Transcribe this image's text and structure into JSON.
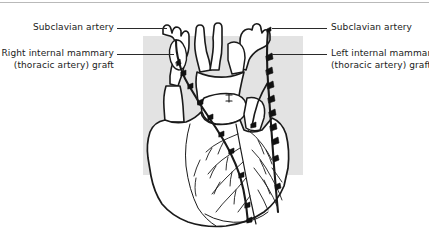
{
  "figure": {
    "background_color": "#ffffff",
    "panel_color": "#e3e3e3",
    "line_color": "#1a1a1a",
    "rule_color": "#b9b9b9"
  },
  "labels": {
    "left_top": {
      "line1": "Subclavian artery",
      "line2": ""
    },
    "left_bottom": {
      "line1": "Right internal mammary",
      "line2": "(thoracic artery) graft"
    },
    "right_top": {
      "line1": "Subclavian artery",
      "line2": ""
    },
    "right_bottom": {
      "line1": "Left internal mammary",
      "line2": "(thoracic artery) graft"
    }
  },
  "anatomy": {
    "parts": [
      "aortic arch",
      "brachiocephalic trunk",
      "left common carotid artery",
      "left subclavian artery",
      "right subclavian artery",
      "superior vena cava",
      "pulmonary trunk",
      "right atrium",
      "right ventricle",
      "left ventricle",
      "left atrial appendage",
      "right internal mammary artery graft",
      "left internal mammary artery graft",
      "left anterior descending coronary artery",
      "diagonal coronary branches",
      "surgical clips on graft side branches"
    ]
  }
}
